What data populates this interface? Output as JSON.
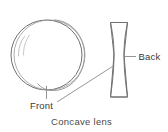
{
  "figure": {
    "caption": "Concave lens",
    "labels": {
      "front": "Front",
      "back": "Back"
    },
    "colors": {
      "background": "#ffffff",
      "stroke": "#6f6f6f",
      "stroke_light": "#9a9a9a",
      "leader": "#8a8a8a",
      "text": "#3a3a3a",
      "caption_text": "#4a4a4a"
    },
    "parts": {
      "front_view": "lens-front-circle",
      "side_view": "lens-cross-section-biconcave",
      "highlights": "glass-reflection-arcs"
    }
  }
}
